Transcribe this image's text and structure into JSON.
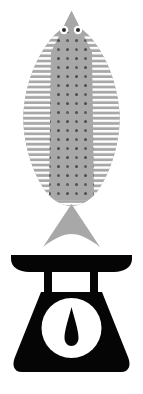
{
  "image": {
    "title": "Fish on weighing scale",
    "subject": "fish-on-kitchen-scale-pictogram",
    "style": "flat-silhouette-icon",
    "width_px": 143,
    "height_px": 394,
    "background_color": "#FFFFFF"
  },
  "palette": {
    "background": "#FFFFFF",
    "fish_body": "#A8A8A8",
    "fish_pattern_stripe": "#FFFFFF",
    "fish_pattern_dot": "#4D4D4D",
    "fish_eye_white": "#FFFFFF",
    "fish_eye_pupil": "#2B2B2B",
    "scale_black": "#050505",
    "scale_dial_face": "#FFFFFF",
    "scale_needle": "#050505"
  },
  "objects": [
    {
      "id": "fish",
      "label": "Fish",
      "color": "#A8A8A8",
      "orientation": "vertical, head up, tail down",
      "bounds_px": {
        "x": 20,
        "y": 11,
        "width": 100,
        "height": 236
      },
      "parts": [
        {
          "id": "fish-head",
          "label": "Head",
          "shape": "triangular snout"
        },
        {
          "id": "fish-eye-left",
          "label": "Left eye",
          "shape": "circle with pupil"
        },
        {
          "id": "fish-eye-right",
          "label": "Right eye",
          "shape": "circle with pupil"
        },
        {
          "id": "fish-body",
          "label": "Body",
          "shape": "leaf / lens oval"
        },
        {
          "id": "fish-fin-left",
          "label": "Left fin stripes",
          "shape": "horizontal ribs"
        },
        {
          "id": "fish-fin-right",
          "label": "Right fin stripes",
          "shape": "horizontal ribs"
        },
        {
          "id": "fish-scales-pattern",
          "label": "Scale dot pattern",
          "shape": "offset dot grid"
        },
        {
          "id": "fish-tail",
          "label": "Tail fin",
          "shape": "concave fan triangle"
        }
      ]
    },
    {
      "id": "scale",
      "label": "Kitchen weighing scale",
      "color": "#050505",
      "bounds_px": {
        "x": 10,
        "y": 254,
        "width": 123,
        "height": 118
      },
      "parts": [
        {
          "id": "scale-pan",
          "label": "Weighing pan",
          "shape": "wide shallow bowl"
        },
        {
          "id": "scale-leg-left",
          "label": "Left support post",
          "shape": "vertical bar"
        },
        {
          "id": "scale-leg-right",
          "label": "Right support post",
          "shape": "vertical bar"
        },
        {
          "id": "scale-body",
          "label": "Scale housing",
          "shape": "rounded trapezoid"
        },
        {
          "id": "scale-dial",
          "label": "Dial face",
          "shape": "circle"
        },
        {
          "id": "scale-needle",
          "label": "Dial needle",
          "shape": "teardrop pointer"
        }
      ]
    }
  ],
  "geometry": {
    "fish": {
      "nose_tip": {
        "x": 71,
        "y": 11
      },
      "widest_y": 115,
      "left_edge_x": 20,
      "right_edge_x": 120,
      "body_bottom_y": 206,
      "tail_top_y": 205,
      "tail_bottom_y": 247,
      "tail_left_x": 43,
      "tail_right_x": 100,
      "eye_radius_px": 4.2,
      "eye_pupil_radius_px": 2.0,
      "eye_left_center": {
        "x": 64,
        "y": 30
      },
      "eye_right_center": {
        "x": 78,
        "y": 30
      },
      "stripe_period_px": 5.2,
      "stripe_thickness_px": 2.4,
      "dot_spacing_x_px": 9,
      "dot_spacing_y_px": 9,
      "dot_radius_px": 1.5
    },
    "scale": {
      "pan_top_y": 255,
      "pan_bottom_y": 272,
      "pan_left_x": 11,
      "pan_right_x": 132,
      "leg_top_y": 272,
      "leg_bottom_y": 293,
      "leg_left_x": 44,
      "leg_right_x": 90,
      "leg_width_px": 8,
      "body_top_y": 292,
      "body_bottom_y": 372,
      "body_top_left_x": 34,
      "body_top_right_x": 109,
      "body_bottom_left_x": 11,
      "body_bottom_right_x": 132,
      "body_corner_radius_px": 9,
      "dial_center": {
        "x": 71.5,
        "y": 328
      },
      "dial_radius_px": 30,
      "needle_tip": {
        "x": 71.5,
        "y": 308
      },
      "needle_bulb_center": {
        "x": 71.5,
        "y": 340
      },
      "needle_bulb_radius_px": 7
    }
  },
  "caption": "Gray patterned fish balanced nose-down on a black kitchen weighing scale"
}
